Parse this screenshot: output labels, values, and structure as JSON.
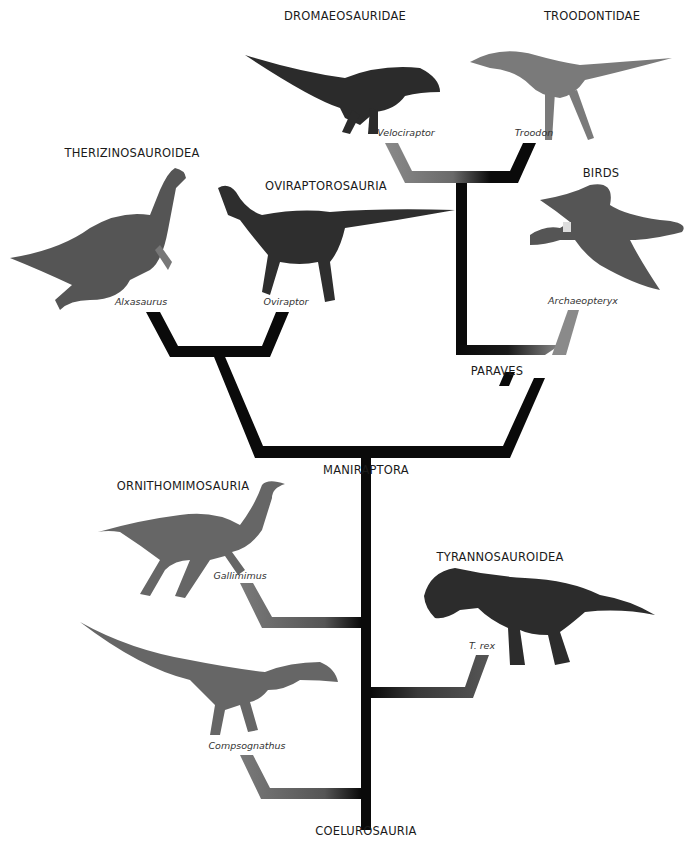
{
  "colors": {
    "branch": "#0a0a0a",
    "branch_fade": "#8a8a8a",
    "text": "#1a1a1a",
    "background": "#ffffff"
  },
  "root": {
    "label": "COELUROSAURIA"
  },
  "nodes": {
    "maniraptora": {
      "label": "MANIRAPTORA"
    },
    "paraves": {
      "label": "PARAVES"
    }
  },
  "groups": [
    {
      "id": "dromaeosauridae",
      "clade": "DROMAEOSAURIDAE",
      "taxon": "Velociraptor"
    },
    {
      "id": "troodontidae",
      "clade": "TROODONTIDAE",
      "taxon": "Troodon"
    },
    {
      "id": "therizinosauroidea",
      "clade": "THERIZINOSAUROIDEA",
      "taxon": "Alxasaurus"
    },
    {
      "id": "oviraptorosauria",
      "clade": "OVIRAPTOROSAURIA",
      "taxon": "Oviraptor"
    },
    {
      "id": "birds",
      "clade": "BIRDS",
      "taxon": "Archaeopteryx"
    },
    {
      "id": "ornithomimosauria",
      "clade": "ORNITHOMIMOSAURIA",
      "taxon": "Gallimimus"
    },
    {
      "id": "tyrannosauroidea",
      "clade": "TYRANNOSAUROIDEA",
      "taxon": "T. rex"
    },
    {
      "id": "compsognathidae",
      "clade": "",
      "taxon": "Compsognathus"
    }
  ]
}
